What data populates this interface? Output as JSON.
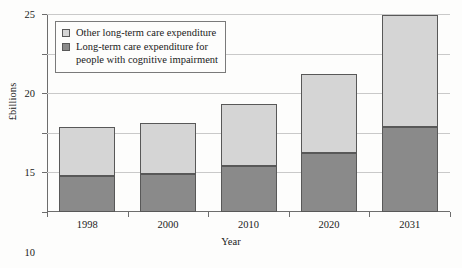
{
  "chart_data": {
    "type": "bar",
    "subtype": "stacked-bar",
    "title": "",
    "xlabel": "Year",
    "ylabel": "£billions",
    "categories": [
      "1998",
      "2000",
      "2010",
      "2020",
      "2031"
    ],
    "series": [
      {
        "name": "Long-term care expenditure for\npeople with cognitive impairment",
        "color": "#8a8a8a",
        "values": [
          4.6,
          4.8,
          5.8,
          7.5,
          10.7
        ]
      },
      {
        "name": "Other long-term care expenditure",
        "color": "#d5d5d5",
        "values": [
          6.0,
          6.3,
          7.7,
          9.8,
          14.0
        ]
      }
    ],
    "totals": [
      10.6,
      11.1,
      13.5,
      17.3,
      24.7
    ],
    "ylim": [
      0,
      25
    ],
    "yticks": [
      0,
      5,
      10,
      15,
      20,
      25
    ],
    "ytick_labels": [
      "0",
      "5",
      "10",
      "15",
      "20",
      "25"
    ],
    "grid": true,
    "legend_position": "top-left",
    "stacking_order": "lower-first"
  },
  "legend": {
    "entries": [
      {
        "label": "Other long-term care expenditure",
        "swatch": "light"
      },
      {
        "label": "Long-term care expenditure for\npeople with cognitive impairment",
        "swatch": "dark"
      }
    ]
  },
  "axes": {
    "y_title": "£billions",
    "x_title": "Year"
  }
}
